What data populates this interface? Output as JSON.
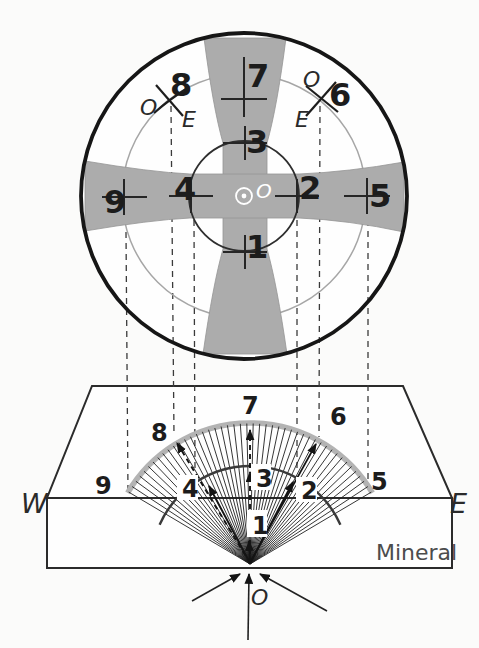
{
  "figure": {
    "top": {
      "center_label": "O",
      "p1": "1",
      "p2": "2",
      "p3": "3",
      "p4": "4",
      "p5": "5",
      "p7": "7",
      "p9": "9",
      "melatope_left": {
        "num": "8",
        "ordinary": "O",
        "extraordinary": "E"
      },
      "melatope_right": {
        "num": "6",
        "ordinary": "O",
        "extraordinary": "E"
      }
    },
    "bottom": {
      "l1": "1",
      "l2": "2",
      "l3": "3",
      "l4": "4",
      "l5": "5",
      "l6": "6",
      "l7": "7",
      "l8": "8",
      "l9": "9",
      "west": "W",
      "east": "E",
      "mineral": "Mineral",
      "origin": "O"
    },
    "colors": {
      "isogyre_gray": "#acacac",
      "ink": "#1c1c1c"
    }
  }
}
